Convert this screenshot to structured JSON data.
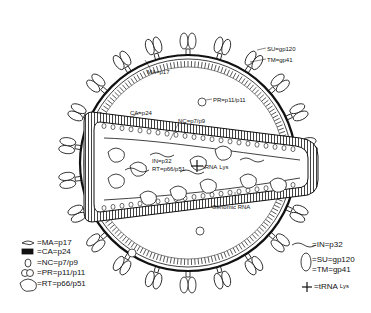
{
  "diagram": {
    "colors": {
      "ink": "#111111",
      "background": "#ffffff"
    },
    "labels": {
      "su": "SU=gp120",
      "tm": "TM=gp41",
      "ma": "MA=p17",
      "pr": "PR=p11/p11",
      "ca": "CA=p24",
      "nc": "NC=p7/p9",
      "in": "IN=p32",
      "rt": "RT=p66/p51",
      "trna": "tRNA",
      "trna_sup": "Lys",
      "genomic_rna": "Genomic RNA"
    },
    "legend_left": [
      {
        "icon": "ma-icon",
        "text": "=MA=p17"
      },
      {
        "icon": "ca-icon",
        "text": "=CA=p24"
      },
      {
        "icon": "nc-icon",
        "text": "=NC=p7/p9"
      },
      {
        "icon": "pr-icon",
        "text": "=PR=p11/p11"
      },
      {
        "icon": "rt-icon",
        "text": "=RT=p66/p51"
      }
    ],
    "legend_right": [
      {
        "icon": "in-icon",
        "text": "=IN=p32"
      },
      {
        "icon": "su-tm-icon",
        "text": "=SU=gp120"
      },
      {
        "icon": "su-tm-icon",
        "text": "=TM=gp41"
      },
      {
        "icon": "trna-icon",
        "text": "=tRNA",
        "sup": "Lys"
      }
    ]
  }
}
